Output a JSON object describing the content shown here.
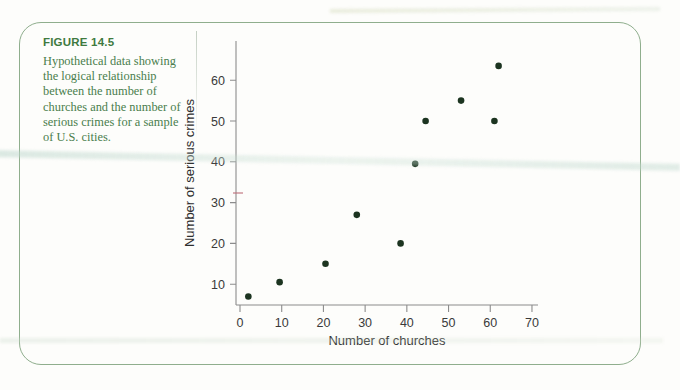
{
  "figure": {
    "number_label": "FIGURE 14.5",
    "caption": "Hypothetical data showing the logical relationship between the number of churches and the number of serious crimes for a sample of U.S. cities.",
    "border_color": "#8fae8d",
    "caption_heading_color": "#3f7a3f",
    "caption_body_color": "#4a7d4d"
  },
  "chart_data": {
    "type": "scatter",
    "title": "",
    "xlabel": "Number of churches",
    "ylabel": "Number of serious crimes",
    "xlim": [
      0,
      73
    ],
    "ylim": [
      0,
      68
    ],
    "xticks": [
      0,
      10,
      20,
      30,
      40,
      50,
      60,
      70
    ],
    "yticks": [
      10,
      20,
      30,
      40,
      50,
      60
    ],
    "grid": false,
    "legend": "none",
    "point_color": "#1c3420",
    "points": [
      {
        "x": 2,
        "y": 7
      },
      {
        "x": 9.5,
        "y": 10.5
      },
      {
        "x": 20.5,
        "y": 15
      },
      {
        "x": 28,
        "y": 27
      },
      {
        "x": 38.5,
        "y": 20
      },
      {
        "x": 42,
        "y": 39.5
      },
      {
        "x": 44.5,
        "y": 50
      },
      {
        "x": 53,
        "y": 55
      },
      {
        "x": 61,
        "y": 50
      },
      {
        "x": 62,
        "y": 63.5
      }
    ]
  }
}
